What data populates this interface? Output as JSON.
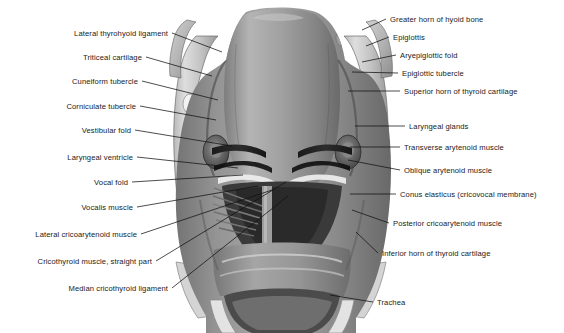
{
  "figure": {
    "type": "anatomical-illustration",
    "style": "grayscale halftone medical drawing",
    "background_color": "#ffffff",
    "ink_color": "#111111",
    "text_color": "#1a1a1a",
    "canvas": {
      "width": 564,
      "height": 333
    }
  },
  "labels_left": [
    {
      "text": "Lateral thyrohyoid ligament",
      "x": 168,
      "y": 33,
      "tip_x": 222,
      "tip_y": 52
    },
    {
      "text": "Triticeal cartilage",
      "x": 142,
      "y": 57,
      "tip_x": 212,
      "tip_y": 76
    },
    {
      "text": "Cuneiform tubercle",
      "x": 138,
      "y": 81,
      "tip_x": 218,
      "tip_y": 100
    },
    {
      "text": "Corniculate tubercle",
      "x": 136,
      "y": 106,
      "tip_x": 216,
      "tip_y": 120
    },
    {
      "text": "Vestibular fold",
      "x": 131,
      "y": 130,
      "tip_x": 232,
      "tip_y": 146
    },
    {
      "text": "Laryngeal ventricle",
      "x": 133,
      "y": 157,
      "tip_x": 238,
      "tip_y": 168
    },
    {
      "text": "Vocal fold",
      "x": 128,
      "y": 182,
      "tip_x": 243,
      "tip_y": 175
    },
    {
      "text": "Vocalis muscle",
      "x": 133,
      "y": 207,
      "tip_x": 258,
      "tip_y": 186
    },
    {
      "text": "Lateral cricoarytenoid muscle",
      "x": 137,
      "y": 234,
      "tip_x": 272,
      "tip_y": 190
    },
    {
      "text": "Cricothyroid muscle, straight part",
      "x": 152,
      "y": 261,
      "tip_x": 286,
      "tip_y": 182
    },
    {
      "text": "Median cricothyroid ligament",
      "x": 168,
      "y": 288,
      "tip_x": 288,
      "tip_y": 196
    }
  ],
  "labels_right": [
    {
      "text": "Greater horn of hyoid bone",
      "x": 390,
      "y": 19,
      "tip_x": 362,
      "tip_y": 30
    },
    {
      "text": "Epiglottis",
      "x": 393,
      "y": 37,
      "tip_x": 366,
      "tip_y": 46
    },
    {
      "text": "Aryepiglottic fold",
      "x": 400,
      "y": 55,
      "tip_x": 362,
      "tip_y": 62
    },
    {
      "text": "Epiglottic tubercle",
      "x": 402,
      "y": 73,
      "tip_x": 352,
      "tip_y": 72
    },
    {
      "text": "Superior horn of thyroid cartilage",
      "x": 404,
      "y": 91,
      "tip_x": 348,
      "tip_y": 91
    },
    {
      "text": "Laryngeal glands",
      "x": 409,
      "y": 126,
      "tip_x": 355,
      "tip_y": 126
    },
    {
      "text": "Transverse arytenoid muscle",
      "x": 404,
      "y": 147,
      "tip_x": 350,
      "tip_y": 147
    },
    {
      "text": "Oblique arytenoid muscle",
      "x": 404,
      "y": 170,
      "tip_x": 348,
      "tip_y": 160
    },
    {
      "text": "Conus elasticus (cricovocal membrane)",
      "x": 400,
      "y": 194,
      "tip_x": 350,
      "tip_y": 194
    },
    {
      "text": "Posterior cricoarytenoid muscle",
      "x": 393,
      "y": 223,
      "tip_x": 352,
      "tip_y": 210
    },
    {
      "text": "Inferior horn of thyroid cartilage",
      "x": 382,
      "y": 253,
      "tip_x": 356,
      "tip_y": 232
    },
    {
      "text": "Trachea",
      "x": 377,
      "y": 302,
      "tip_x": 330,
      "tip_y": 295
    }
  ]
}
